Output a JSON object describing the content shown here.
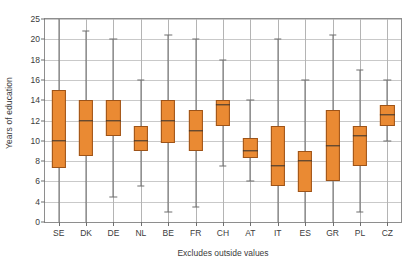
{
  "chart_data": {
    "type": "box",
    "title": "",
    "subtitle": "",
    "xlabel": "Excludes outside values",
    "ylabel": "Years of education",
    "grid": "horizontal-and-vertical",
    "legend": "none",
    "ylim": [
      0,
      25
    ],
    "ytick_labels": [
      "0",
      "4",
      "6",
      "8",
      "10",
      "12",
      "14",
      "16",
      "18",
      "20",
      "25"
    ],
    "ytick_values": [
      0,
      4,
      6,
      8,
      10,
      12,
      14,
      16,
      18,
      20,
      25
    ],
    "categories": [
      "SE",
      "DK",
      "DE",
      "NL",
      "BE",
      "FR",
      "CH",
      "AT",
      "IT",
      "ES",
      "GR",
      "PL",
      "CZ"
    ],
    "series": [
      {
        "name": "Years of education",
        "boxes": [
          {
            "category": "SE",
            "whisker_low": 0.0,
            "q1": 7.3,
            "median": 10.0,
            "q3": 15.0,
            "whisker_high": 25.0
          },
          {
            "category": "DK",
            "whisker_low": 0.0,
            "q1": 8.5,
            "median": 12.0,
            "q3": 14.0,
            "whisker_high": 22.0
          },
          {
            "category": "DE",
            "whisker_low": 4.5,
            "q1": 10.5,
            "median": 12.0,
            "q3": 14.0,
            "whisker_high": 20.0
          },
          {
            "category": "NL",
            "whisker_low": 5.5,
            "q1": 9.0,
            "median": 10.0,
            "q3": 11.5,
            "whisker_high": 16.0
          },
          {
            "category": "BE",
            "whisker_low": 2.0,
            "q1": 9.8,
            "median": 12.0,
            "q3": 14.0,
            "whisker_high": 21.0
          },
          {
            "category": "FR",
            "whisker_low": 3.0,
            "q1": 9.0,
            "median": 11.0,
            "q3": 13.0,
            "whisker_high": 20.0
          },
          {
            "category": "CH",
            "whisker_low": 7.5,
            "q1": 11.5,
            "median": 13.5,
            "q3": 14.0,
            "whisker_high": 18.0
          },
          {
            "category": "AT",
            "whisker_low": 6.0,
            "q1": 8.3,
            "median": 9.0,
            "q3": 10.3,
            "whisker_high": 14.0
          },
          {
            "category": "IT",
            "whisker_low": 0.0,
            "q1": 5.5,
            "median": 7.5,
            "q3": 11.5,
            "whisker_high": 20.0
          },
          {
            "category": "ES",
            "whisker_low": 0.0,
            "q1": 5.0,
            "median": 8.0,
            "q3": 9.0,
            "whisker_high": 16.0
          },
          {
            "category": "GR",
            "whisker_low": 0.0,
            "q1": 6.0,
            "median": 9.5,
            "q3": 13.0,
            "whisker_high": 21.0
          },
          {
            "category": "PL",
            "whisker_low": 2.0,
            "q1": 7.5,
            "median": 10.5,
            "q3": 11.5,
            "whisker_high": 17.0
          },
          {
            "category": "CZ",
            "whisker_low": 10.0,
            "q1": 11.5,
            "median": 12.5,
            "q3": 13.5,
            "whisker_high": 16.0
          }
        ]
      }
    ],
    "colors": {
      "box_fill": "#ea8a33",
      "box_border": "#9d5318",
      "median": "#2f2f2f",
      "whisker": "#6e6e6e",
      "grid": "#c9c9c9",
      "axis": "#8e8e8e",
      "text": "#3b3b3b",
      "background": "#ffffff"
    }
  }
}
